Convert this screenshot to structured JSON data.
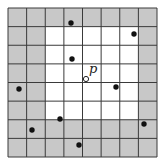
{
  "diagram": {
    "type": "grid-neighborhood",
    "grid": {
      "cols": 8,
      "rows": 8,
      "origin": [
        8,
        8
      ],
      "size": 149,
      "line_color": "#3a3a3a",
      "outer_fill": "#c8c8c8",
      "inner_fill": "#ffffff"
    },
    "highlight_region": {
      "col_start": 2,
      "col_end": 7,
      "row_start": 1,
      "row_end": 6,
      "description": "5x5 white neighborhood around p"
    },
    "query_point": {
      "label": "p",
      "x": 86,
      "y": 79,
      "label_x": 89,
      "label_y": 73,
      "style": "open-circle"
    },
    "points": [
      {
        "x": 71,
        "y": 23
      },
      {
        "x": 134,
        "y": 34
      },
      {
        "x": 72,
        "y": 59
      },
      {
        "x": 19,
        "y": 89
      },
      {
        "x": 116,
        "y": 87
      },
      {
        "x": 60,
        "y": 119
      },
      {
        "x": 144,
        "y": 124
      },
      {
        "x": 32,
        "y": 130
      },
      {
        "x": 79,
        "y": 145
      }
    ]
  }
}
